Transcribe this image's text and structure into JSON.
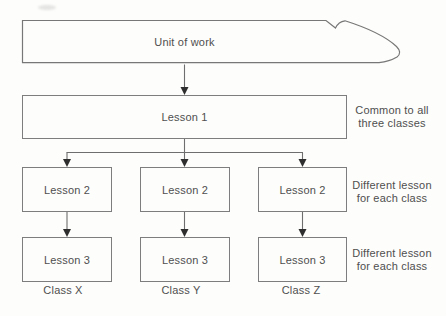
{
  "canvas": {
    "width": 446,
    "height": 316
  },
  "colors": {
    "background": "#fdfdfb",
    "line": "#6e6e6e",
    "box_border": "#7d7d7d",
    "arrowhead": "#2e2e2e",
    "text": "#4f4f4f"
  },
  "banner": {
    "label": "Unit of work"
  },
  "lesson1": {
    "label": "Lesson 1"
  },
  "columns": [
    {
      "lesson2": "Lesson 2",
      "lesson3": "Lesson 3",
      "class_label": "Class X"
    },
    {
      "lesson2": "Lesson 2",
      "lesson3": "Lesson 3",
      "class_label": "Class Y"
    },
    {
      "lesson2": "Lesson 2",
      "lesson3": "Lesson 3",
      "class_label": "Class Z"
    }
  ],
  "side_notes": [
    {
      "line1": "Common to all",
      "line2": "three classes"
    },
    {
      "line1": "Different lesson",
      "line2": "for each class"
    },
    {
      "line1": "Different lesson",
      "line2": "for each class"
    }
  ]
}
